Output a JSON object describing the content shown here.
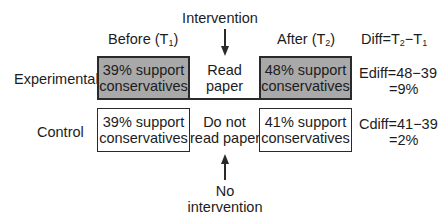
{
  "headers": {
    "intervention": "Intervention",
    "before_prefix": "Before (T",
    "before_sub": "1",
    "before_suffix": ")",
    "after_prefix": "After (T",
    "after_sub": "2",
    "after_suffix": ")",
    "diff_prefix": "Diff=T",
    "diff_sub1": "2",
    "diff_mid": "−T",
    "diff_sub2": "1"
  },
  "rows": {
    "experimental": {
      "label": "Experimental",
      "before": [
        "39% support",
        "conservatives"
      ],
      "treatment": [
        "Read",
        "paper"
      ],
      "after": [
        "48% support",
        "conservatives"
      ],
      "diff_line1": "Ediff=48−39",
      "diff_line2": "=9%"
    },
    "control": {
      "label": "Control",
      "before": [
        "39% support",
        "conservatives"
      ],
      "treatment": [
        "Do not",
        "read paper"
      ],
      "after": [
        "41% support",
        "conservatives"
      ],
      "diff_line1": "Cdiff=41−39",
      "diff_line2": "=2%"
    }
  },
  "footer": {
    "no_intervention": [
      "No",
      "intervention"
    ]
  },
  "colors": {
    "shaded_box": "#a9a9a9",
    "line": "#2a2a2a"
  }
}
